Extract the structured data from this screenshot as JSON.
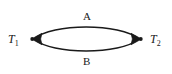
{
  "figure": {
    "type": "directed-graph",
    "background_color": "#ffffff",
    "stroke_color": "#1a1a1a",
    "width": 172,
    "height": 74
  },
  "nodes": [
    {
      "id": "T1",
      "label_base": "T",
      "label_sub": "1",
      "x": 33,
      "y": 39,
      "marker": "filled-dot"
    },
    {
      "id": "T2",
      "label_base": "T",
      "label_sub": "2",
      "x": 140,
      "y": 39,
      "marker": "filled-dot"
    }
  ],
  "edges": [
    {
      "id": "A",
      "label": "A",
      "from": "T2",
      "to": "T1",
      "side": "top",
      "arrowhead": "left",
      "label_x": 88,
      "label_y": 16
    },
    {
      "id": "B",
      "label": "B",
      "from": "T1",
      "to": "T2",
      "side": "bottom",
      "arrowhead": "right",
      "label_x": 88,
      "label_y": 61
    }
  ]
}
